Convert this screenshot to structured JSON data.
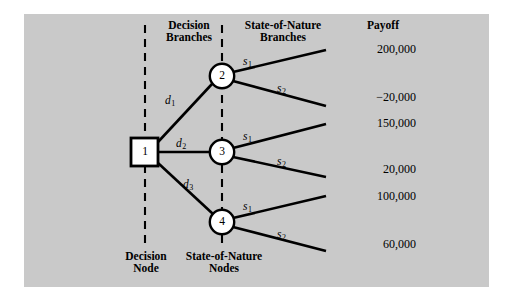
{
  "figure": {
    "type": "decision-tree",
    "background_color": "#c9c9c9",
    "frame_color": "#ffffff",
    "line_color": "#000000",
    "node_fill": "#ffffff"
  },
  "headers": {
    "decision_branches_line1": "Decision",
    "decision_branches_line2": "Branches",
    "state_branches_line1": "State-of-Nature",
    "state_branches_line2": "Branches",
    "payoff": "Payoff"
  },
  "footers": {
    "decision_node_line1": "Decision",
    "decision_node_line2": "Node",
    "state_nodes_line1": "State-of-Nature",
    "state_nodes_line2": "Nodes"
  },
  "nodes": [
    {
      "id": "1",
      "label": "1",
      "shape": "square",
      "kind": "decision-node",
      "cx": 145,
      "cy": 152
    },
    {
      "id": "2",
      "label": "2",
      "shape": "circle",
      "kind": "state-of-nature-node",
      "cx": 222,
      "cy": 76
    },
    {
      "id": "3",
      "label": "3",
      "shape": "circle",
      "kind": "state-of-nature-node",
      "cx": 222,
      "cy": 152
    },
    {
      "id": "4",
      "label": "4",
      "shape": "circle",
      "kind": "state-of-nature-node",
      "cx": 222,
      "cy": 222
    }
  ],
  "decision_branches": [
    {
      "id": "d1",
      "base": "d",
      "sub": "1",
      "from": "1",
      "to": "2"
    },
    {
      "id": "d2",
      "base": "d",
      "sub": "2",
      "from": "1",
      "to": "3"
    },
    {
      "id": "d3",
      "base": "d",
      "sub": "3",
      "from": "1",
      "to": "4"
    }
  ],
  "state_branches": [
    {
      "id": "s1-n2",
      "base": "s",
      "sub": "1",
      "from": "2",
      "payoff": "200,000"
    },
    {
      "id": "s2-n2",
      "base": "s",
      "sub": "2",
      "from": "2",
      "payoff": "−20,000"
    },
    {
      "id": "s1-n3",
      "base": "s",
      "sub": "1",
      "from": "3",
      "payoff": "150,000"
    },
    {
      "id": "s2-n3",
      "base": "s",
      "sub": "2",
      "from": "3",
      "payoff": "20,000"
    },
    {
      "id": "s1-n4",
      "base": "s",
      "sub": "1",
      "from": "4",
      "payoff": "100,000"
    },
    {
      "id": "s2-n4",
      "base": "s",
      "sub": "2",
      "from": "4",
      "payoff": "60,000"
    }
  ],
  "payoffs": [
    {
      "value": "200,000",
      "y": 58
    },
    {
      "value": "−20,000",
      "y": 105
    },
    {
      "value": "150,000",
      "y": 131
    },
    {
      "value": "20,000",
      "y": 175
    },
    {
      "value": "100,000",
      "y": 203
    },
    {
      "value": "60,000",
      "y": 250
    }
  ],
  "guides": [
    {
      "id": "decision-node-guide",
      "x": 145,
      "y1": 25,
      "y2": 248
    },
    {
      "id": "state-nodes-guide",
      "x": 222,
      "y1": 25,
      "y2": 248
    }
  ]
}
